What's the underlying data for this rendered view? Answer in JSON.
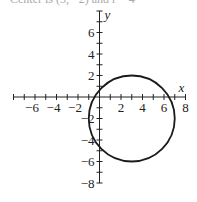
{
  "caption": "Center is (3, −2) and r = 4",
  "chart_data": {
    "type": "line",
    "title": "",
    "xlabel": "x",
    "ylabel": "y",
    "xlim": [
      -8,
      8
    ],
    "ylim": [
      -8,
      8
    ],
    "x_ticks": [
      -6,
      -4,
      -2,
      2,
      4,
      6,
      8
    ],
    "y_ticks": [
      6,
      4,
      2,
      -2,
      -4,
      -6,
      -8
    ],
    "x_tick_labels": [
      "−6",
      "−4",
      "−2",
      "2",
      "4",
      "6",
      "8"
    ],
    "y_tick_labels": [
      "6",
      "4",
      "2",
      "−2",
      "−4",
      "−6",
      "−8"
    ],
    "grid": false,
    "series": [
      {
        "name": "circle",
        "shape": "circle",
        "center": [
          3,
          -2
        ],
        "radius": 4,
        "color": "#1a1a1a"
      }
    ]
  }
}
